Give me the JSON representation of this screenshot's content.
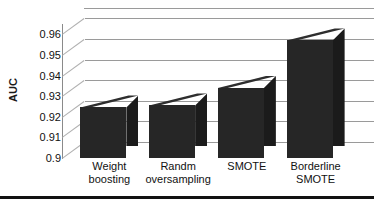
{
  "chart_data": {
    "type": "bar",
    "title": "",
    "subtitle": "",
    "xlabel": "",
    "ylabel": "AUC",
    "categories": [
      "Weight boosting",
      "Randm oversampling",
      "SMOTE",
      "Borderline SMOTE"
    ],
    "category_lines": [
      [
        "Weight",
        "boosting"
      ],
      [
        "Randm",
        "oversampling"
      ],
      [
        "SMOTE"
      ],
      [
        "Borderline",
        "SMOTE"
      ]
    ],
    "values": [
      0.9245,
      0.9255,
      0.934,
      0.957
    ],
    "ylim": [
      0.9,
      0.965
    ],
    "yticks": [
      0.9,
      0.91,
      0.92,
      0.93,
      0.94,
      0.95,
      0.96
    ],
    "ytick_labels": [
      "0.9",
      "0.91",
      "0.92",
      "0.93",
      "0.94",
      "0.95",
      "0.96"
    ],
    "grid": true,
    "legend": "none",
    "style": "3d-column",
    "bar_color": "#262626",
    "grid_color": "#9a9a9a",
    "axis_color": "#8a8a8a",
    "text_color": "#111111",
    "background": "#ffffff"
  }
}
